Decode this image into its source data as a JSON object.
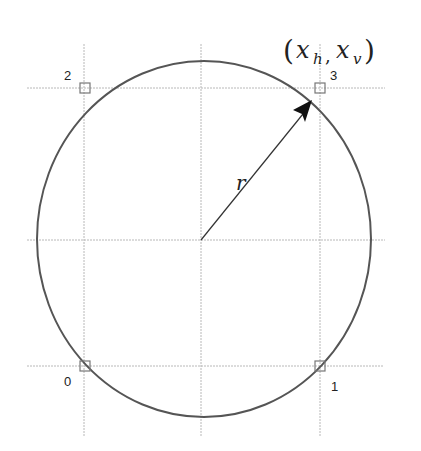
{
  "diagram": {
    "title_point": {
      "open": "(",
      "x_h": "x",
      "h_sub": "h",
      "comma": ",",
      "x_v": "x",
      "v_sub": "v",
      "close": ")"
    },
    "radius_label": "r",
    "corner_labels": {
      "p0": "0",
      "p1": "1",
      "p2": "2",
      "p3": "3"
    },
    "colors": {
      "circle": "#555555",
      "grid": "#b8b8b8",
      "arrow": "#333333",
      "marker": "#777777"
    }
  }
}
